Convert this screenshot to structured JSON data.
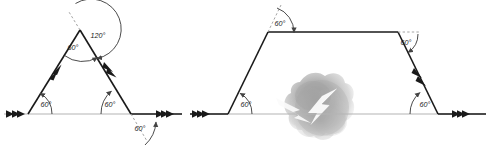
{
  "figure": {
    "background_color": "#ffffff",
    "stroke_color": "#1a1a1a",
    "baseline_color": "#b0b0b0",
    "dashed_color": "#9a9a9a",
    "watermark_color": "#a8a8a8",
    "diagrams": [
      {
        "name": "triangle-zigzag",
        "shape": "triangle-on-baseline",
        "angles": [
          {
            "id": "tri-base-left",
            "value": "60°",
            "x": 46,
            "y": 104,
            "position": "interior-left-base"
          },
          {
            "id": "tri-apex-interior",
            "value": "60°",
            "x": 71,
            "y": 47,
            "position": "interior-apex"
          },
          {
            "id": "tri-apex-exterior",
            "value": "120°",
            "x": 95,
            "y": 37,
            "position": "exterior-apex"
          },
          {
            "id": "tri-base-right-interior",
            "value": "60°",
            "x": 108,
            "y": 104,
            "position": "interior-right-base"
          },
          {
            "id": "tri-base-right-exterior",
            "value": "60°",
            "x": 134,
            "y": 128,
            "position": "exterior-right-base"
          }
        ]
      },
      {
        "name": "trapezoid-zigzag",
        "shape": "trapezoid-on-baseline",
        "angles": [
          {
            "id": "trap-top-left",
            "value": "60°",
            "x": 278,
            "y": 24,
            "position": "exterior-top-left"
          },
          {
            "id": "trap-top-right",
            "value": "60°",
            "x": 405,
            "y": 42,
            "position": "interior-top-right"
          },
          {
            "id": "trap-base-left",
            "value": "60°",
            "x": 246,
            "y": 105,
            "position": "interior-left-base"
          },
          {
            "id": "trap-base-right",
            "value": "60°",
            "x": 424,
            "y": 104,
            "position": "interior-right-base"
          }
        ]
      }
    ],
    "watermark": {
      "name": "cloud-lightning-watermark",
      "label": "lightning-bolt-icon",
      "center_x": 320,
      "center_y": 110
    }
  }
}
